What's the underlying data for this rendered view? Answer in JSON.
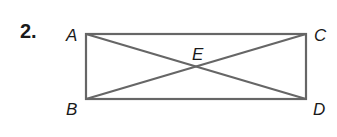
{
  "problem": {
    "number": "2."
  },
  "figure": {
    "type": "rectangle with diagonals",
    "points": {
      "A": {
        "label": "A",
        "x": 86,
        "y": 34
      },
      "C": {
        "label": "C",
        "x": 306,
        "y": 34
      },
      "B": {
        "label": "B",
        "x": 86,
        "y": 99
      },
      "D": {
        "label": "D",
        "x": 306,
        "y": 99
      },
      "E": {
        "label": "E",
        "x": 196,
        "y": 67
      }
    },
    "segments": [
      "AC",
      "CD",
      "DB",
      "BA",
      "AD",
      "BC"
    ],
    "stroke_color": "#666666"
  }
}
